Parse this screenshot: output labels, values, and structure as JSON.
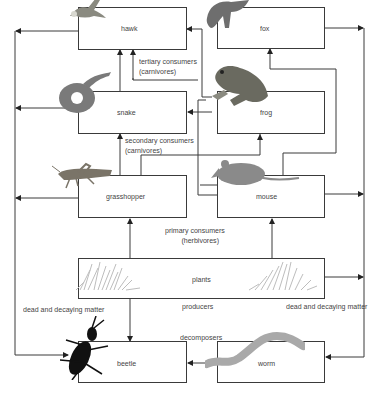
{
  "diagram": {
    "type": "food web",
    "organisms": [
      {
        "id": "hawk",
        "label": "hawk"
      },
      {
        "id": "fox",
        "label": "fox"
      },
      {
        "id": "snake",
        "label": "snake"
      },
      {
        "id": "frog",
        "label": "frog"
      },
      {
        "id": "grasshopper",
        "label": "grasshopper"
      },
      {
        "id": "mouse",
        "label": "mouse"
      },
      {
        "id": "plants",
        "label": "plants"
      },
      {
        "id": "beetle",
        "label": "beetle"
      },
      {
        "id": "worm",
        "label": "worm"
      }
    ],
    "levels": {
      "tertiary": {
        "line1": "tertiary consumers",
        "line2": "(carnivores)"
      },
      "secondary": {
        "line1": "secondary consumers",
        "line2": "(carnivores)"
      },
      "primary": {
        "line1": "primary consumers",
        "line2": "(herbivores)"
      },
      "producers": "producers",
      "decomposers": "decomposers"
    },
    "side_labels": {
      "left": "dead and decaying matter",
      "right": "dead and decaying matter"
    },
    "edges": [
      {
        "from": "plants",
        "to": "grasshopper"
      },
      {
        "from": "plants",
        "to": "mouse"
      },
      {
        "from": "plants",
        "to": "beetle"
      },
      {
        "from": "grasshopper",
        "to": "snake"
      },
      {
        "from": "grasshopper",
        "to": "frog"
      },
      {
        "from": "mouse",
        "to": "fox"
      },
      {
        "from": "mouse",
        "to": "snake"
      },
      {
        "from": "mouse",
        "to": "hawk"
      },
      {
        "from": "snake",
        "to": "hawk"
      },
      {
        "from": "frog",
        "to": "snake"
      },
      {
        "from": "frog",
        "to": "hawk"
      },
      {
        "from": "hawk",
        "to": "beetle",
        "via": "dead and decaying matter"
      },
      {
        "from": "snake",
        "to": "beetle",
        "via": "dead and decaying matter"
      },
      {
        "from": "grasshopper",
        "to": "beetle",
        "via": "dead and decaying matter"
      },
      {
        "from": "fox",
        "to": "worm",
        "via": "dead and decaying matter"
      },
      {
        "from": "mouse",
        "to": "worm",
        "via": "dead and decaying matter"
      },
      {
        "from": "plants",
        "to": "worm",
        "via": "dead and decaying matter"
      },
      {
        "from": "worm",
        "to": "beetle"
      }
    ]
  }
}
